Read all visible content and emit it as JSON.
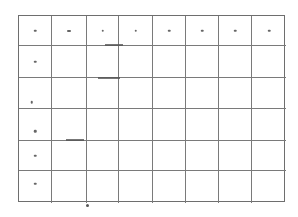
{
  "grid": {
    "columns": 8,
    "rows": 6,
    "line_color": "#7a7a7a",
    "background": "#ffffff",
    "header_row_marks": [
      "•",
      "•",
      "•",
      "•",
      "•",
      "•",
      "•",
      "•"
    ],
    "first_column_marks": [
      "•",
      "•",
      "•",
      "•",
      "•",
      "•"
    ],
    "cells": [
      [
        "•",
        "•",
        "•",
        "•",
        "•",
        "•",
        "•",
        "•"
      ],
      [
        "•",
        "",
        "",
        "",
        "",
        "",
        "",
        ""
      ],
      [
        "•",
        "",
        "",
        "",
        "",
        "",
        "",
        ""
      ],
      [
        "•",
        "",
        "",
        "",
        "",
        "",
        "",
        ""
      ],
      [
        "•",
        "",
        "",
        "",
        "",
        "",
        "",
        ""
      ],
      [
        "•",
        "",
        "",
        "",
        "",
        "",
        "",
        ""
      ]
    ]
  }
}
